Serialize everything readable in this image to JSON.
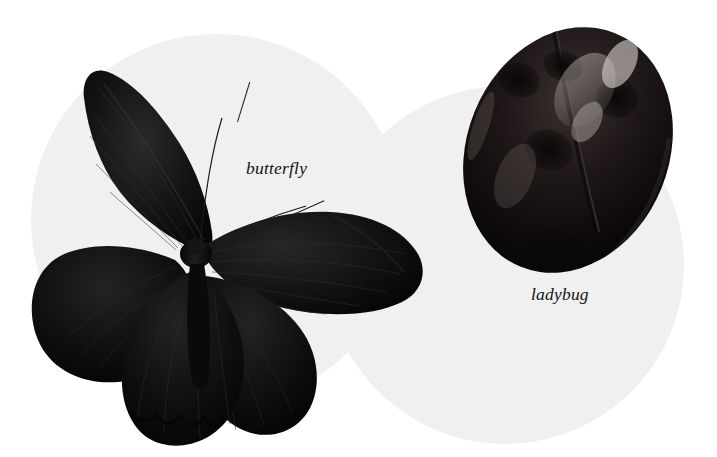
{
  "canvas": {
    "width": 717,
    "height": 457,
    "background_color": "#ffffff"
  },
  "background_shapes": {
    "circle_color": "#f0f0f0",
    "circles": [
      {
        "name": "left-circle",
        "cx": 217,
        "cy": 220,
        "r": 186
      },
      {
        "name": "right-circle",
        "cx": 505,
        "cy": 265,
        "r": 179
      }
    ]
  },
  "subjects": [
    {
      "id": "butterfly",
      "label": "butterfly",
      "description": "black butterfly with spread wings, two antennae",
      "color": "#0b0b0b"
    },
    {
      "id": "ladybug",
      "label": "ladybug",
      "description": "dark glossy oval ladybug beetle seen from above",
      "color": "#120d0d"
    }
  ],
  "labels": {
    "butterfly": "butterfly",
    "ladybug": "ladybug",
    "text_color": "#131313",
    "font_size_px": 17.5,
    "style": "italic serif"
  },
  "annotations": {
    "leader_line_color": "#1a1a1a"
  }
}
